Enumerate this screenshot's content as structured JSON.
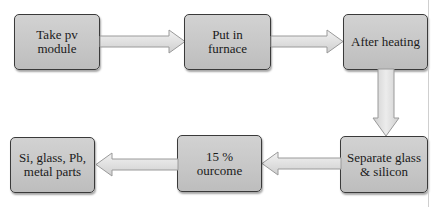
{
  "diagram": {
    "type": "flowchart",
    "nodes": [
      {
        "id": "n1",
        "label": "Take pv\nmodule"
      },
      {
        "id": "n2",
        "label": "Put in\nfurnace"
      },
      {
        "id": "n3",
        "label": "After heating"
      },
      {
        "id": "n4",
        "label": "Separate glass\n& silicon"
      },
      {
        "id": "n5",
        "label": "15 %\nourcome"
      },
      {
        "id": "n6",
        "label": "Si, glass, Pb,\nmetal parts"
      }
    ],
    "edges": [
      {
        "from": "n1",
        "to": "n2",
        "direction": "right"
      },
      {
        "from": "n2",
        "to": "n3",
        "direction": "right"
      },
      {
        "from": "n3",
        "to": "n4",
        "direction": "down"
      },
      {
        "from": "n4",
        "to": "n5",
        "direction": "left"
      },
      {
        "from": "n5",
        "to": "n6",
        "direction": "left"
      }
    ]
  },
  "colors": {
    "box_fill": "#c8c8c8",
    "box_border": "#3a3a3a",
    "arrow_fill": "#e2e2e2",
    "arrow_stroke": "#9a9a9a"
  }
}
